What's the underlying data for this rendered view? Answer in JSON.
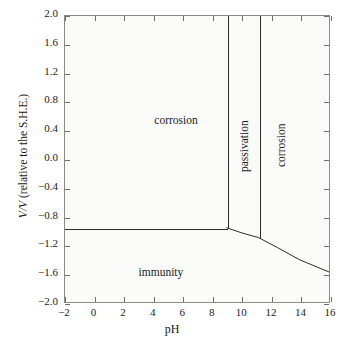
{
  "chart_data": {
    "type": "line",
    "title": "",
    "xlabel": "pH",
    "ylabel": "V/V (relative to the S.H.E.)",
    "ylabel_italic_prefix": "V/V",
    "ylabel_rest": " (relative to the S.H.E.)",
    "xlim": [
      -2,
      16
    ],
    "ylim": [
      -2.0,
      2.0
    ],
    "xticks": [
      "-2",
      "0",
      "2",
      "4",
      "6",
      "8",
      "10",
      "12",
      "14",
      "16"
    ],
    "xtick_values": [
      -2,
      0,
      2,
      4,
      6,
      8,
      10,
      12,
      14,
      16
    ],
    "yticks": [
      "2.0",
      "1.6",
      "1.2",
      "0.8",
      "0.4",
      "0.0",
      "-0.4",
      "-0.8",
      "-1.2",
      "-1.6",
      "-2.0"
    ],
    "ytick_values": [
      2.0,
      1.6,
      1.2,
      0.8,
      0.4,
      0.0,
      -0.4,
      -0.8,
      -1.2,
      -1.6,
      -2.0
    ],
    "grid": false,
    "legend": "none",
    "line_color": "#2a2a2a",
    "background_color": "#fbfbfa",
    "frame_color": "#8a8a8a",
    "boundaries": [
      {
        "name": "corrosion-passivation-vertical",
        "kind": "vertical",
        "ph": 9.0,
        "v_from": -0.96,
        "v_to": 2.0
      },
      {
        "name": "passivation-corrosion-vertical",
        "kind": "vertical",
        "ph": 11.2,
        "v_from": -1.1,
        "v_to": 2.0
      },
      {
        "name": "corrosion-immunity-horizontal",
        "kind": "horizontal",
        "v": -0.96,
        "ph_from": -2,
        "ph_to": 9.0
      },
      {
        "name": "immunity-upper-sloped",
        "kind": "curve",
        "points": [
          {
            "ph": 9.0,
            "v": -0.96
          },
          {
            "ph": 10.0,
            "v": -1.03
          },
          {
            "ph": 11.2,
            "v": -1.1
          },
          {
            "ph": 12.5,
            "v": -1.24
          },
          {
            "ph": 14.0,
            "v": -1.41
          },
          {
            "ph": 16.0,
            "v": -1.58
          }
        ]
      }
    ],
    "regions": [
      {
        "name": "corrosion-left",
        "label": "corrosion",
        "ph": 5.5,
        "v": 0.55,
        "orientation": "horizontal"
      },
      {
        "name": "passivation",
        "label": "passivation",
        "ph": 10.1,
        "v": 0.2,
        "orientation": "vertical"
      },
      {
        "name": "corrosion-right",
        "label": "corrosion",
        "ph": 12.6,
        "v": 0.2,
        "orientation": "vertical"
      },
      {
        "name": "immunity",
        "label": "immunity",
        "ph": 4.5,
        "v": -1.55,
        "orientation": "horizontal"
      }
    ]
  }
}
